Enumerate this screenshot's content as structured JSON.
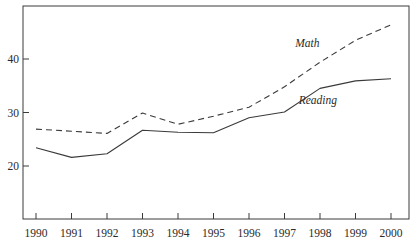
{
  "chart_data": {
    "type": "line",
    "title": "",
    "xlabel": "",
    "ylabel": "",
    "x": [
      1990,
      1991,
      1992,
      1993,
      1994,
      1995,
      1996,
      1997,
      1998,
      1999,
      2000
    ],
    "series": [
      {
        "name": "Math",
        "style": "dashed",
        "values": [
          26.9,
          26.5,
          26.1,
          29.9,
          27.8,
          29.3,
          31.0,
          34.8,
          39.4,
          43.5,
          46.4
        ]
      },
      {
        "name": "Reading",
        "style": "solid",
        "values": [
          23.4,
          21.6,
          22.3,
          26.7,
          26.3,
          26.2,
          29.0,
          30.1,
          34.5,
          35.9,
          36.3
        ]
      }
    ],
    "yticks": [
      20,
      30,
      40
    ],
    "xticks": [
      "1990",
      "1991",
      "1992",
      "1993",
      "1994",
      "1995",
      "1996",
      "1997",
      "1998",
      "1999",
      "2000"
    ],
    "ylim": [
      10.1,
      49.9
    ],
    "xlim": [
      1989.6,
      2000.5
    ],
    "grid": false,
    "legend": "inline labels",
    "annotations": [
      {
        "text": "Math",
        "x": 1997.3,
        "y": 42.2
      },
      {
        "text": "Reading",
        "x": 1997.4,
        "y": 31.5
      }
    ]
  },
  "colors": {
    "line": "#3a3a3a",
    "frame": "#3a3a3a",
    "text": "#2a2a2a",
    "background": "#ffffff"
  }
}
